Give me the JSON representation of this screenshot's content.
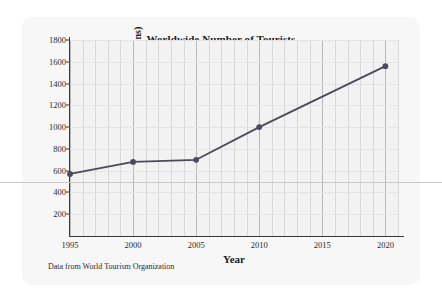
{
  "chart_data": {
    "type": "line",
    "title": "Worldwide Number of Tourists",
    "xlabel": "Year",
    "ylabel": "Tourists (in millions)",
    "caption": "Data from World Tourism Organization",
    "x": [
      1995,
      2000,
      2005,
      2010,
      2020
    ],
    "values": [
      570,
      680,
      700,
      1000,
      1560
    ],
    "series": [
      {
        "name": "Worldwide tourists",
        "values": [
          570,
          680,
          700,
          1000,
          1560
        ],
        "color": "#4a4a5a",
        "marker": "circle"
      }
    ],
    "xlim": [
      1995,
      2021
    ],
    "ylim": [
      0,
      1800
    ],
    "xticks": [
      1995,
      2000,
      2005,
      2010,
      2015,
      2020
    ],
    "xtick_labels": [
      "1995",
      "2000",
      "2005",
      "2010",
      "2015",
      "2020"
    ],
    "yticks": [
      200,
      400,
      600,
      800,
      1000,
      1200,
      1400,
      1600,
      1800
    ],
    "ytick_labels": [
      "200",
      "400",
      "600",
      "800",
      "1000",
      "1200",
      "1400",
      "1600",
      "1800"
    ],
    "grid": true,
    "grid_minor_x_step": 1,
    "grid_major_x_step": 5,
    "legend": false,
    "legend_position": "none",
    "background_color": "#f2f2f2",
    "card_color": "#f7f7f7",
    "axis_color": "#3a3a3a"
  }
}
